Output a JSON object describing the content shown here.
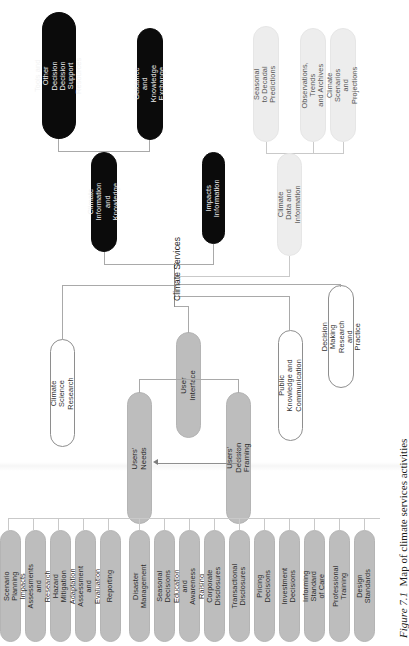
{
  "figure": {
    "number": "Figure 7.1",
    "caption": "Map of climate services activities"
  },
  "diagram": {
    "root": {
      "label": "Climate Services"
    },
    "branches": [
      {
        "label": "Climate Information and Knowledge",
        "style": "black",
        "children": [
          {
            "label": "Tools and Other Decision\nDecision Support\nResources",
            "style": "black"
          },
          {
            "label": "Guidance and\nKnowledge Exchange",
            "style": "black"
          }
        ]
      },
      {
        "label": "Impacts Information",
        "style": "black",
        "children": []
      },
      {
        "label": "Climate Data and\nInformation",
        "style": "light-grey",
        "children": [
          {
            "label": "Seasonal to Decadal\nPredictions",
            "style": "light-grey"
          },
          {
            "label": "Observations, Trends\nand Archives",
            "style": "light-grey"
          },
          {
            "label": "Climate Scenarios and\nProjections",
            "style": "light-grey"
          }
        ]
      },
      {
        "label": "Climate Science\nResearch",
        "style": "white",
        "children": []
      },
      {
        "label": "User Interface",
        "style": "grey",
        "children": [
          {
            "label": "Users' Needs",
            "style": "grey"
          },
          {
            "label": "Users' Decision Framing",
            "style": "grey"
          }
        ]
      },
      {
        "label": "Public Knowledge and\nCommunication",
        "style": "white",
        "children": []
      },
      {
        "label": "Decision Making\nResearch and Practice",
        "style": "white",
        "children": []
      }
    ],
    "activities": [
      {
        "label": "Scenario Planning"
      },
      {
        "label": "Impacts Assessments\nand Research"
      },
      {
        "label": "Hazard Mitigation"
      },
      {
        "label": "Adaptation Assessment\nand Evaluation"
      },
      {
        "label": "Reporting"
      },
      {
        "label": "Disaster Management"
      },
      {
        "label": "Seasonal Decisions"
      },
      {
        "label": "Education and\nAwareness Raising"
      },
      {
        "label": "Corporate Disclosures"
      },
      {
        "label": "Transactional Disclosures"
      },
      {
        "label": "Pricing Decisions"
      },
      {
        "label": "Investment Decisions"
      },
      {
        "label": "Informing Standard\nof Care"
      },
      {
        "label": "Professional Training"
      },
      {
        "label": "Design Standards"
      }
    ],
    "feedback_arrow": {
      "from": "Users' Decision Framing",
      "to": "Users' Needs"
    },
    "colors": {
      "black": "#0b0b0b",
      "grey": "#bdbdbd",
      "light_grey": "#ededed",
      "white": "#ffffff",
      "line": "#a9a9a9"
    }
  }
}
